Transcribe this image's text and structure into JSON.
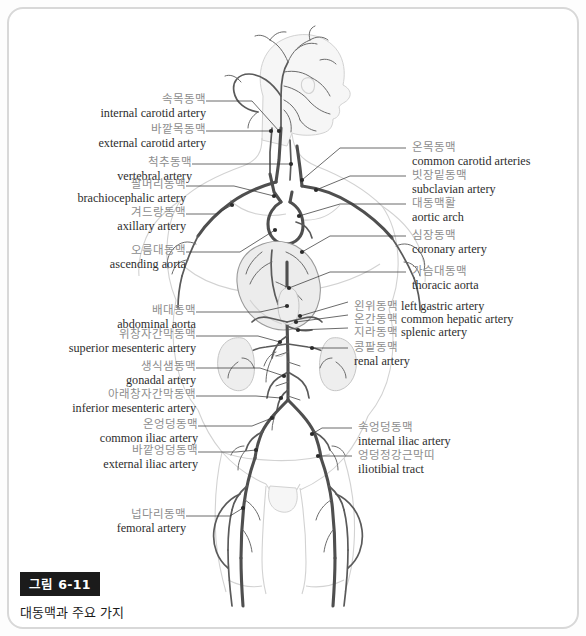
{
  "figure": {
    "caption_badge": "그림 6-11",
    "caption_text": "대동맥과 주요 가지",
    "alt_title": "대동맥과 주요 가지 — Aorta and its major branches"
  },
  "colors": {
    "vessel": "#4a4a4a",
    "body_outline": "#cfcfcf",
    "leader_line": "#4a4a4a",
    "label_ko": "#8d8d8d",
    "label_en": "#2e2e2e",
    "frame_border": "#d8d8d8",
    "badge_background": "#1b1b1b",
    "badge_text": "#ffffff",
    "background": "#ffffff"
  },
  "labels_left": [
    {
      "ko": "속목동맥",
      "en": "internal carotid artery"
    },
    {
      "ko": "바깥목동맥",
      "en": "external carotid artery"
    },
    {
      "ko": "척추동맥",
      "en": "vertebral artery"
    },
    {
      "ko": "팔머리동맥",
      "en": "brachiocephalic artery"
    },
    {
      "ko": "겨드랑동맥",
      "en": "axillary artery"
    },
    {
      "ko": "오름대동맥",
      "en": "ascending aorta"
    },
    {
      "ko": "배대동맥",
      "en": "abdominal aorta"
    },
    {
      "ko": "위창자간막동맥",
      "en": "superior mesenteric artery"
    },
    {
      "ko": "생식샘동맥",
      "en": "gonadal artery"
    },
    {
      "ko": "아래창자간막동맥",
      "en": "inferior mesenteric artery"
    },
    {
      "ko": "온엉덩동맥",
      "en": "common iliac artery"
    },
    {
      "ko": "바깥엉덩동맥",
      "en": "external iliac artery"
    },
    {
      "ko": "넙다리동맥",
      "en": "femoral artery"
    }
  ],
  "labels_right": [
    {
      "ko": "온목동맥",
      "en": "common carotid arteries"
    },
    {
      "ko": "빗장밑동맥",
      "en": "subclavian artery"
    },
    {
      "ko": "대동맥활",
      "en": "aortic arch"
    },
    {
      "ko": "심장동맥",
      "en": "coronary artery"
    },
    {
      "ko": "가슴대동맥",
      "en": "thoracic aorta"
    },
    {
      "ko": "왼위동맥",
      "en": "left gastric artery"
    },
    {
      "ko": "온간동맥",
      "en": "common hepatic artery"
    },
    {
      "ko": "지라동맥",
      "en": "splenic artery"
    },
    {
      "ko": "콩팥동맥",
      "en": "renal artery"
    },
    {
      "ko": "속엉덩동맥",
      "en": "internal iliac artery"
    },
    {
      "ko": "엉덩정강근막띠",
      "en": "iliotibial tract"
    }
  ]
}
